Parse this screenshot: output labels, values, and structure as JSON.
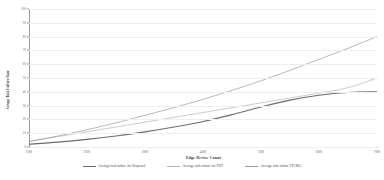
{
  "chart_data": {
    "type": "line",
    "title": "",
    "xlabel": "Edge Device Count",
    "ylabel": "Avrage Task Failure Rate",
    "xlim": [
      1000,
      7000
    ],
    "ylim": [
      0,
      100
    ],
    "xticks": [
      "1000",
      "2000",
      "3000",
      "4000",
      "5000",
      "6000",
      "7000"
    ],
    "yticks": [
      "0",
      "10",
      "20",
      "30",
      "40",
      "50",
      "60",
      "70",
      "80",
      "90",
      "100"
    ],
    "grid": true,
    "legend_position": "bottom",
    "x": [
      1000,
      1500,
      2000,
      2500,
      3000,
      3500,
      4000,
      4500,
      5000,
      5500,
      6000,
      6500,
      7000
    ],
    "series": [
      {
        "name": "Average task failure for Proposed",
        "color": "#6b6b6b",
        "values": [
          2,
          3.5,
          5.5,
          8,
          11,
          14.5,
          18.5,
          23.5,
          29,
          34,
          37.5,
          39.5,
          40
        ]
      },
      {
        "name": "Average task failure for  FDT",
        "color": "#b6b6b6",
        "values": [
          4,
          7.5,
          11,
          14.5,
          18,
          21.5,
          25,
          28.5,
          32,
          35.5,
          39,
          43,
          50
        ]
      },
      {
        "name": "Average task failure FTCMA",
        "color": "#9a9a9a",
        "values": [
          4,
          8,
          12.5,
          17.5,
          23,
          28.5,
          34.5,
          41,
          48,
          55.5,
          63.5,
          71.5,
          80
        ]
      }
    ]
  }
}
